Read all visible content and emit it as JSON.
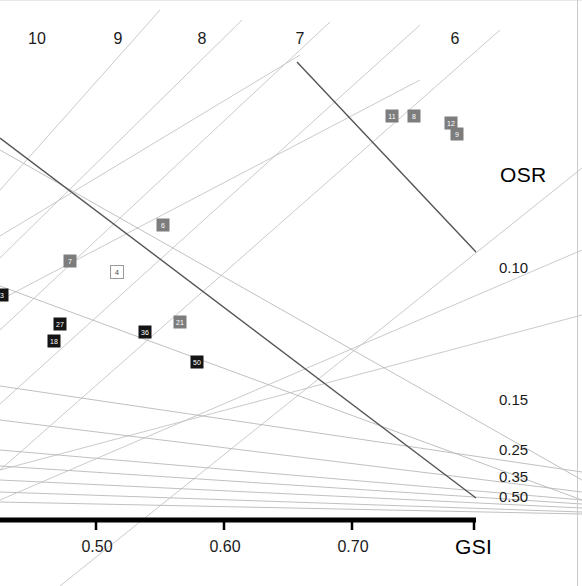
{
  "chart_data": {
    "type": "scatter",
    "title": "",
    "xlabel": "GSI",
    "ylabel": "OSR",
    "top_axis_label": "",
    "xlim": [
      0.44,
      0.765
    ],
    "grid": false,
    "legend_position": "none",
    "axes": {
      "bottom": {
        "name": "GSI",
        "ticks": [
          {
            "label": "0.50",
            "value": 0.5,
            "px": 96
          },
          {
            "label": "0.60",
            "value": 0.6,
            "px": 224
          },
          {
            "label": "0.70",
            "value": 0.7,
            "px": 352
          }
        ]
      },
      "right": {
        "name": "OSR",
        "ticks": [
          {
            "label": "0.10",
            "value": 0.1,
            "px_y": 268
          },
          {
            "label": "0.15",
            "value": 0.15,
            "px_y": 400
          },
          {
            "label": "0.25",
            "value": 0.25,
            "px_y": 450
          },
          {
            "label": "0.35",
            "value": 0.35,
            "px_y": 477
          },
          {
            "label": "0.50",
            "value": 0.5,
            "px_y": 497
          }
        ]
      },
      "top": {
        "name": "",
        "ticks": [
          {
            "label": "10",
            "value": 10,
            "px": 37
          },
          {
            "label": "9",
            "value": 9,
            "px": 118
          },
          {
            "label": "8",
            "value": 8,
            "px": 202
          },
          {
            "label": "7",
            "value": 7,
            "px": 300
          },
          {
            "label": "6",
            "value": 6,
            "px": 455
          }
        ]
      }
    },
    "series": [
      {
        "name": "gray-markers",
        "marker": "square-filled",
        "color": "#7d7d7d",
        "points": [
          {
            "label": "11",
            "px": 392,
            "py": 116
          },
          {
            "label": "8",
            "px": 414,
            "py": 116
          },
          {
            "label": "12",
            "px": 451,
            "py": 123
          },
          {
            "label": "9",
            "px": 457,
            "py": 134
          },
          {
            "label": "6",
            "px": 163,
            "py": 225
          },
          {
            "label": "7",
            "px": 70,
            "py": 261
          },
          {
            "label": "21",
            "px": 180,
            "py": 322
          }
        ]
      },
      {
        "name": "black-markers",
        "marker": "square-filled",
        "color": "#141414",
        "points": [
          {
            "label": "27",
            "px": 60,
            "py": 324
          },
          {
            "label": "18",
            "px": 54,
            "py": 341
          },
          {
            "label": "36",
            "px": 145,
            "py": 332
          },
          {
            "label": "50",
            "px": 197,
            "py": 362
          },
          {
            "label": "3",
            "px": 2,
            "py": 295
          }
        ]
      },
      {
        "name": "open-markers",
        "marker": "square-open",
        "color": "#9a9a9a",
        "points": [
          {
            "label": "4",
            "px": 117,
            "py": 272
          }
        ]
      }
    ],
    "isopleths_ascending": {
      "description": "light gray lines rising to the right",
      "color": "#c4c4c4",
      "lines": [
        [
          0,
          190,
          160,
          10
        ],
        [
          0,
          258,
          242,
          20
        ],
        [
          0,
          330,
          330,
          22
        ],
        [
          0,
          404,
          420,
          25
        ],
        [
          0,
          470,
          500,
          30
        ],
        [
          0,
          236,
          300,
          55
        ],
        [
          0,
          300,
          420,
          80
        ],
        [
          60,
          586,
          582,
          168
        ],
        [
          0,
          500,
          582,
          250
        ],
        [
          0,
          470,
          582,
          315
        ]
      ]
    },
    "isopleths_descending": {
      "description": "gray lines falling to the right, converging at bottom",
      "color": "#b9b9b9",
      "lines": [
        [
          0,
          150,
          582,
          480
        ],
        [
          0,
          286,
          582,
          500
        ],
        [
          0,
          386,
          582,
          472
        ],
        [
          0,
          420,
          582,
          492
        ],
        [
          0,
          450,
          582,
          500
        ],
        [
          0,
          466,
          582,
          504
        ],
        [
          0,
          480,
          582,
          508
        ],
        [
          0,
          492,
          582,
          512
        ],
        [
          0,
          502,
          582,
          514
        ]
      ]
    },
    "highlight_lines": {
      "description": "two darker emphasis lines",
      "color": "#555555",
      "lines": [
        [
          0,
          138,
          476,
          498
        ],
        [
          297,
          62,
          476,
          252
        ]
      ]
    },
    "annotations": []
  },
  "figure": {
    "gsi_axis_title": "GSI",
    "osr_axis_title": "OSR"
  }
}
